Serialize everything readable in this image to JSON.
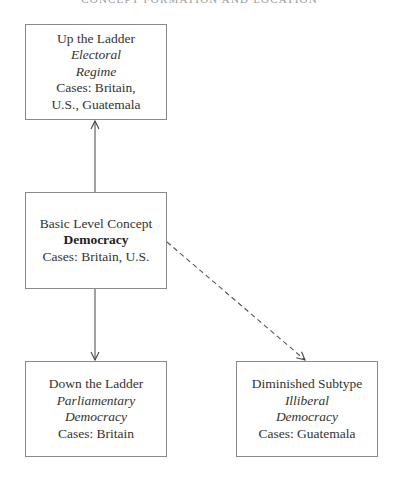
{
  "header": {
    "running_title": "CONCEPT FORMATION AND LOCATION"
  },
  "diagram": {
    "nodes": {
      "up": {
        "level_label": "Up the Ladder",
        "concept_line1": "Electoral",
        "concept_line2": "Regime",
        "cases_line1": "Cases: Britain,",
        "cases_line2": "U.S., Guatemala"
      },
      "basic": {
        "level_label": "Basic Level Concept",
        "concept": "Democracy",
        "cases": "Cases: Britain, U.S."
      },
      "down": {
        "level_label": "Down the Ladder",
        "concept_line1": "Parliamentary",
        "concept_line2": "Democracy",
        "cases": "Cases: Britain"
      },
      "diminished": {
        "level_label": "Diminished Subtype",
        "concept_line1": "Illiberal",
        "concept_line2": "Democracy",
        "cases": "Cases: Guatemala"
      }
    },
    "edges": [
      {
        "from": "basic",
        "to": "up",
        "style": "solid"
      },
      {
        "from": "basic",
        "to": "down",
        "style": "solid"
      },
      {
        "from": "basic",
        "to": "diminished",
        "style": "dashed"
      }
    ],
    "colors": {
      "box_border": "#8a8a8a",
      "line": "#555555",
      "text": "#333333"
    }
  }
}
